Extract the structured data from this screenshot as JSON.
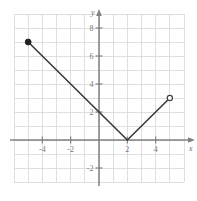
{
  "chart_data": {
    "type": "line",
    "title": "",
    "subtitle": "",
    "xlabel": "x",
    "ylabel": "y",
    "xlim": [
      -6,
      6
    ],
    "ylim": [
      -3,
      9
    ],
    "grid": true,
    "grid_spacing": 1,
    "legend": "none",
    "x_ticks": [
      -4,
      -2,
      2,
      4
    ],
    "y_ticks": [
      -2,
      2,
      4,
      6,
      8
    ],
    "x_tick_labels": [
      "-4",
      "-2",
      "2",
      "4"
    ],
    "y_tick_labels": [
      "-2",
      "2",
      "4",
      "6",
      "8"
    ],
    "series": [
      {
        "name": "decreasing-branch",
        "points": [
          [
            -5,
            7
          ],
          [
            2,
            0
          ]
        ],
        "slope": -1
      },
      {
        "name": "increasing-branch",
        "points": [
          [
            2,
            0
          ],
          [
            5,
            3
          ]
        ],
        "slope": 1
      }
    ],
    "vertex": [
      2,
      0
    ],
    "endpoints": [
      {
        "name": "left-endpoint",
        "x": -5,
        "y": 7,
        "style": "closed"
      },
      {
        "name": "right-endpoint",
        "x": 5,
        "y": 3,
        "style": "open"
      }
    ],
    "annotations": []
  },
  "colors": {
    "grid": "#d8d6d8",
    "axis": "#808084",
    "curve": "#3a3a3a",
    "tick_text": "#7a7a7e",
    "background": "#ffffff"
  }
}
